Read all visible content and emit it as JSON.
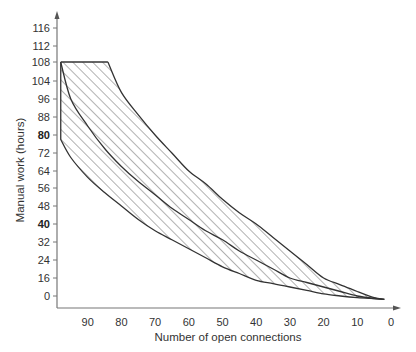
{
  "chart_data": {
    "type": "area",
    "title": "",
    "xlabel": "Number of open connections",
    "ylabel": "Manual work (hours)",
    "x_axis": {
      "reversed": true,
      "ticks": [
        90,
        80,
        70,
        60,
        50,
        40,
        30,
        20,
        10,
        0
      ],
      "range": [
        98,
        0
      ]
    },
    "y_axis": {
      "ticks": [
        "0",
        "16",
        "24",
        "32",
        "40",
        "48",
        "56",
        "64",
        "72",
        "80",
        "88",
        "96",
        "104",
        "108",
        "112",
        "116"
      ],
      "bold_ticks": [
        "40",
        "80"
      ],
      "range": [
        -4,
        120
      ]
    },
    "grid": false,
    "legend": null,
    "series": [
      {
        "name": "Upper bound",
        "x": [
          84,
          80,
          75,
          70,
          65,
          60,
          55,
          50,
          45,
          40,
          35,
          30,
          25,
          20,
          15,
          10,
          5,
          2
        ],
        "y": [
          108,
          99,
          89,
          80,
          72,
          64,
          58,
          51,
          45,
          40,
          34,
          28,
          22,
          16,
          10,
          4,
          -2,
          -4
        ]
      },
      {
        "name": "Expected",
        "x": [
          98,
          95,
          90,
          85,
          80,
          75,
          70,
          65,
          60,
          55,
          50,
          45,
          40,
          35,
          30,
          25,
          20,
          15,
          10,
          5,
          2
        ],
        "y": [
          108,
          96,
          84,
          74,
          66,
          59,
          53,
          47,
          42,
          37,
          33,
          28,
          24,
          20,
          16,
          12,
          8,
          4,
          0,
          -3,
          -4
        ]
      },
      {
        "name": "Lower bound",
        "x": [
          98,
          98,
          95,
          90,
          85,
          80,
          75,
          70,
          65,
          60,
          55,
          50,
          45,
          40,
          35,
          30,
          25,
          20,
          15,
          10,
          5,
          2
        ],
        "y": [
          108,
          78,
          70,
          61,
          54,
          48,
          42,
          37,
          33,
          29,
          25,
          21,
          18,
          14,
          11,
          8,
          5,
          2,
          0,
          -2,
          -3,
          -4
        ]
      }
    ],
    "annotations": [
      {
        "type": "hatched-band",
        "between": [
          "Lower bound",
          "Upper bound"
        ],
        "cap": "flat top at 108 from x=98 to x=84"
      }
    ],
    "colors": {
      "line": "#333333",
      "hatch": "#555555",
      "axis": "#777777",
      "text": "#333333"
    }
  }
}
